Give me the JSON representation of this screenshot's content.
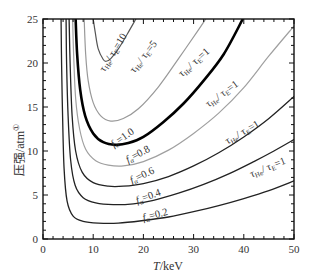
{
  "chart_data": {
    "type": "line",
    "title": "",
    "xlabel": "T/keV",
    "ylabel": "压强/atm①",
    "xlim": [
      0,
      50
    ],
    "ylim": [
      0,
      25
    ],
    "xticks": [
      0,
      10,
      20,
      30,
      40,
      50
    ],
    "yticks": [
      0,
      5,
      10,
      15,
      20,
      25
    ],
    "grid": false,
    "legend": "none (inline curve labels)",
    "series": [
      {
        "name": "τHe/τE=10",
        "color": "#555555",
        "width": 1.2,
        "points": [
          [
            10.0,
            25
          ],
          [
            10.4,
            23.5
          ],
          [
            11.0,
            21.6
          ],
          [
            12.0,
            20.4
          ],
          [
            12.6,
            20.2
          ],
          [
            13.5,
            20.5
          ],
          [
            15.0,
            21.6
          ],
          [
            16.8,
            23.3
          ],
          [
            18.5,
            25
          ]
        ]
      },
      {
        "name": "τHe/τE=5",
        "color": "#999999",
        "width": 1.2,
        "points": [
          [
            8.2,
            25
          ],
          [
            8.5,
            21
          ],
          [
            9.0,
            18
          ],
          [
            10.0,
            15.5
          ],
          [
            11.5,
            14.0
          ],
          [
            13.5,
            13.4
          ],
          [
            16.0,
            13.7
          ],
          [
            19.0,
            14.8
          ],
          [
            23.0,
            17.3
          ],
          [
            27.0,
            20.5
          ],
          [
            31.0,
            23.8
          ],
          [
            32.4,
            25
          ]
        ]
      },
      {
        "name": "fα=1.0 / τHe/τE=1",
        "color": "#000000",
        "width": 2.6,
        "points": [
          [
            6.5,
            25
          ],
          [
            6.8,
            21
          ],
          [
            7.4,
            17
          ],
          [
            8.4,
            14
          ],
          [
            10.0,
            12.0
          ],
          [
            12.0,
            11.0
          ],
          [
            14.5,
            10.7
          ],
          [
            17.0,
            10.9
          ],
          [
            20.0,
            11.6
          ],
          [
            24.0,
            13.3
          ],
          [
            28.0,
            15.4
          ],
          [
            32.0,
            18.0
          ],
          [
            36.0,
            21.0
          ],
          [
            39.8,
            25
          ]
        ]
      },
      {
        "name": "fα=0.8 / τHe/τE=1",
        "color": "#a0a0a0",
        "width": 1.2,
        "points": [
          [
            5.9,
            25
          ],
          [
            6.1,
            21
          ],
          [
            6.5,
            16
          ],
          [
            7.3,
            12.5
          ],
          [
            8.5,
            10.2
          ],
          [
            10.5,
            8.9
          ],
          [
            13.0,
            8.4
          ],
          [
            16.0,
            8.3
          ],
          [
            20.0,
            8.8
          ],
          [
            25.0,
            10.1
          ],
          [
            30.0,
            12.0
          ],
          [
            35.0,
            14.3
          ],
          [
            40.0,
            17.2
          ],
          [
            45.0,
            20.8
          ],
          [
            50.0,
            24.2
          ]
        ]
      },
      {
        "name": "fα=0.6 / τHe/τE=1",
        "color": "#222222",
        "width": 1.3,
        "points": [
          [
            5.2,
            25
          ],
          [
            5.4,
            20
          ],
          [
            5.8,
            14
          ],
          [
            6.5,
            10
          ],
          [
            7.8,
            7.6
          ],
          [
            10.0,
            6.4
          ],
          [
            13.0,
            6.0
          ],
          [
            16.0,
            6.0
          ],
          [
            20.0,
            6.3
          ],
          [
            25.0,
            7.1
          ],
          [
            30.0,
            8.3
          ],
          [
            35.0,
            9.8
          ],
          [
            40.0,
            11.6
          ],
          [
            45.0,
            13.7
          ],
          [
            50.0,
            16.2
          ]
        ]
      },
      {
        "name": "fα=0.4 / τHe/τE=1",
        "color": "#222222",
        "width": 1.3,
        "points": [
          [
            4.6,
            25
          ],
          [
            4.7,
            20
          ],
          [
            5.0,
            14
          ],
          [
            5.5,
            9
          ],
          [
            6.4,
            6.1
          ],
          [
            8.0,
            4.7
          ],
          [
            10.5,
            4.1
          ],
          [
            14.0,
            3.9
          ],
          [
            18.0,
            4.0
          ],
          [
            22.0,
            4.4
          ],
          [
            27.0,
            5.2
          ],
          [
            32.0,
            6.2
          ],
          [
            37.0,
            7.4
          ],
          [
            42.0,
            8.8
          ],
          [
            46.0,
            10.0
          ],
          [
            50.0,
            11.3
          ]
        ]
      },
      {
        "name": "fα=0.2 / τHe/τE=1",
        "color": "#222222",
        "width": 1.3,
        "points": [
          [
            3.6,
            25
          ],
          [
            3.7,
            20
          ],
          [
            3.9,
            14
          ],
          [
            4.2,
            8
          ],
          [
            4.8,
            4.3
          ],
          [
            6.0,
            2.6
          ],
          [
            8.0,
            2.0
          ],
          [
            11.0,
            1.8
          ],
          [
            15.0,
            1.8
          ],
          [
            20.0,
            2.1
          ],
          [
            25.0,
            2.5
          ],
          [
            30.0,
            3.1
          ],
          [
            35.0,
            3.8
          ],
          [
            40.0,
            4.6
          ],
          [
            45.0,
            5.5
          ],
          [
            50.0,
            6.6
          ]
        ]
      }
    ],
    "annotations": [
      {
        "text": "τHe/τE=10",
        "x": 14.5,
        "y": 21.0,
        "rotate": -58
      },
      {
        "text": "τHe/τE=5",
        "x": 20.5,
        "y": 20.5,
        "rotate": -52
      },
      {
        "text": "τHe/τE=1",
        "x": 30.5,
        "y": 19.8,
        "rotate": -42
      },
      {
        "text": "τHe/τE=1",
        "x": 36.0,
        "y": 16.2,
        "rotate": -36
      },
      {
        "text": "τHe/τE=1",
        "x": 40.0,
        "y": 11.8,
        "rotate": -30
      },
      {
        "text": "τHe/τE=1",
        "x": 45.0,
        "y": 7.8,
        "rotate": -22
      },
      {
        "text": "fα=1.0",
        "x": 16.2,
        "y": 11.2,
        "rotate": -35
      },
      {
        "text": "fα=0.8",
        "x": 19.2,
        "y": 9.3,
        "rotate": -28
      },
      {
        "text": "fα=0.6",
        "x": 20.0,
        "y": 6.9,
        "rotate": -25
      },
      {
        "text": "fα=0.4",
        "x": 21.2,
        "y": 4.5,
        "rotate": -20
      },
      {
        "text": "fα=0.2",
        "x": 22.5,
        "y": 2.4,
        "rotate": -14
      }
    ]
  },
  "axes": {
    "x_tick_labels": [
      "0",
      "10",
      "20",
      "30",
      "40",
      "50"
    ],
    "y_tick_labels": [
      "0",
      "5",
      "10",
      "15",
      "20",
      "25"
    ],
    "xlabel_italic": "T",
    "xlabel_rest": "/keV",
    "ylabel_text": "压强/atm",
    "ylabel_sup": "①"
  }
}
